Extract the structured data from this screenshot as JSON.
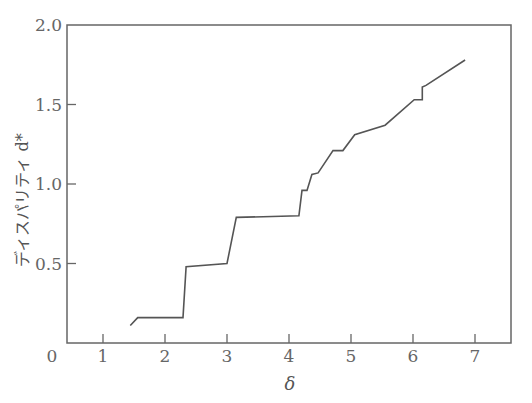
{
  "chart_data": {
    "type": "line",
    "title": "",
    "xlabel": "δ",
    "ylabel": "ディスパリティ d*",
    "xlim": [
      0,
      7.5
    ],
    "ylim": [
      0,
      2.0
    ],
    "x_ticks": [
      "0",
      "1",
      "2",
      "3",
      "4",
      "5",
      "6",
      "7"
    ],
    "y_ticks": [
      "0.5",
      "1.0",
      "1.5",
      "2.0"
    ],
    "grid": false,
    "legend": null,
    "series": [
      {
        "name": "d*",
        "x": [
          1.44,
          1.56,
          2.29,
          2.34,
          3.0,
          3.15,
          4.16,
          4.21,
          4.29,
          4.37,
          4.47,
          4.71,
          4.87,
          5.06,
          5.55,
          6.02,
          6.15,
          6.15,
          6.21,
          6.84
        ],
        "y": [
          0.11,
          0.16,
          0.16,
          0.48,
          0.5,
          0.79,
          0.8,
          0.96,
          0.96,
          1.06,
          1.07,
          1.21,
          1.21,
          1.31,
          1.37,
          1.53,
          1.53,
          1.61,
          1.62,
          1.78
        ]
      }
    ],
    "colors": {
      "line": "#555555",
      "axis": "#666666"
    }
  }
}
